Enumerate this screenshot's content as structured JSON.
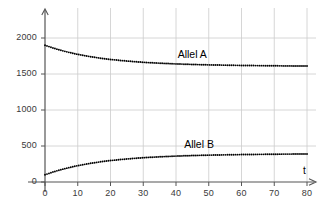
{
  "chart_data": {
    "type": "line",
    "title": "",
    "subtitle": "",
    "xlabel": "t",
    "ylabel": "",
    "xlim": [
      0,
      82
    ],
    "ylim": [
      0,
      2060
    ],
    "grid": true,
    "legend_position": "inline-annotations",
    "style": "dotted",
    "xticks": [
      0,
      10,
      20,
      30,
      40,
      50,
      60,
      70,
      80
    ],
    "xtick_labels": [
      "0",
      "10",
      "20",
      "30",
      "40",
      "50",
      "60",
      "70",
      "80"
    ],
    "yticks": [
      0,
      500,
      1000,
      1500,
      2000
    ],
    "ytick_labels": [
      "0",
      "500",
      "1000",
      "1500",
      "2000"
    ],
    "series": [
      {
        "name": "Allel A",
        "color": "#000000",
        "label_x": 46,
        "label_y": 1760,
        "x": [
          0,
          2,
          4,
          6,
          8,
          10,
          12,
          14,
          16,
          18,
          20,
          24,
          28,
          32,
          36,
          40,
          44,
          48,
          52,
          56,
          60,
          64,
          68,
          72,
          76,
          80
        ],
        "values": [
          1900,
          1868,
          1840,
          1815,
          1793,
          1773,
          1756,
          1740,
          1726,
          1713,
          1702,
          1684,
          1669,
          1657,
          1648,
          1640,
          1634,
          1629,
          1625,
          1622,
          1619,
          1617,
          1615,
          1613,
          1612,
          1611
        ]
      },
      {
        "name": "Allel B",
        "color": "#000000",
        "label_x": 48,
        "label_y": 520,
        "x": [
          0,
          2,
          4,
          6,
          8,
          10,
          12,
          14,
          16,
          18,
          20,
          24,
          28,
          32,
          36,
          40,
          44,
          48,
          52,
          56,
          60,
          64,
          68,
          72,
          76,
          80
        ],
        "values": [
          100,
          132,
          160,
          185,
          207,
          227,
          244,
          260,
          274,
          287,
          298,
          316,
          331,
          343,
          352,
          360,
          366,
          371,
          375,
          378,
          381,
          383,
          385,
          387,
          388,
          389
        ]
      }
    ]
  },
  "axis": {
    "x_arrow": true,
    "y_arrow": true,
    "x_axis_label": "t",
    "axis_color": "#555555",
    "grid_color": "#cccccc"
  },
  "labels": {
    "series_a": "Allel A",
    "series_b": "Allel B"
  }
}
